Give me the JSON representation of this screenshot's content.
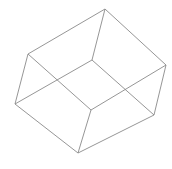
{
  "figure": {
    "stroke_color": "#8a8a8a",
    "background": "#ffffff",
    "vertices": {
      "A": [
        105,
        9
      ],
      "B": [
        28,
        54
      ],
      "C": [
        166,
        65
      ],
      "D": [
        92,
        60
      ],
      "E": [
        15,
        104
      ],
      "F": [
        91,
        110
      ],
      "G": [
        154,
        115
      ],
      "H": [
        78,
        153
      ]
    },
    "edges": [
      [
        "A",
        "B"
      ],
      [
        "A",
        "C"
      ],
      [
        "A",
        "D"
      ],
      [
        "B",
        "E"
      ],
      [
        "B",
        "F"
      ],
      [
        "D",
        "E"
      ],
      [
        "D",
        "G"
      ],
      [
        "C",
        "F"
      ],
      [
        "C",
        "G"
      ],
      [
        "E",
        "H"
      ],
      [
        "F",
        "H"
      ],
      [
        "G",
        "H"
      ]
    ]
  }
}
